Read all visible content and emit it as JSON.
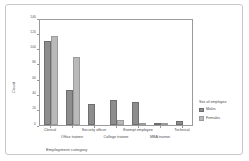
{
  "chart_data": {
    "type": "bar",
    "title": "",
    "xlabel": "Employment category",
    "ylabel": "Count",
    "ylim": [
      0,
      140
    ],
    "yticks": [
      0,
      20,
      40,
      60,
      80,
      100,
      120,
      140
    ],
    "grid": false,
    "legend_position": "right",
    "legend_title": "Sex of employee",
    "categories": [
      "Clerical",
      "Office trainee",
      "Security officer",
      "College trainee",
      "Exempt employee",
      "MBA trainee",
      "Technical"
    ],
    "series": [
      {
        "name": "Males",
        "color": "#8d8d8d",
        "values": [
          110,
          46,
          27,
          33,
          30,
          1,
          5
        ]
      },
      {
        "name": "Females",
        "color": "#b9b9b9",
        "values": [
          117,
          89,
          0,
          6,
          1,
          1,
          0
        ]
      }
    ]
  },
  "axis": {
    "y_title": "Count",
    "x_title": "Employment category",
    "y_tick_labels": [
      "0",
      "20",
      "40",
      "60",
      "80",
      "100",
      "120",
      "140"
    ]
  },
  "legend": {
    "title": "Sex of employee",
    "entries": [
      {
        "label": "Males",
        "swatch": "male"
      },
      {
        "label": "Females",
        "swatch": "female"
      }
    ]
  }
}
